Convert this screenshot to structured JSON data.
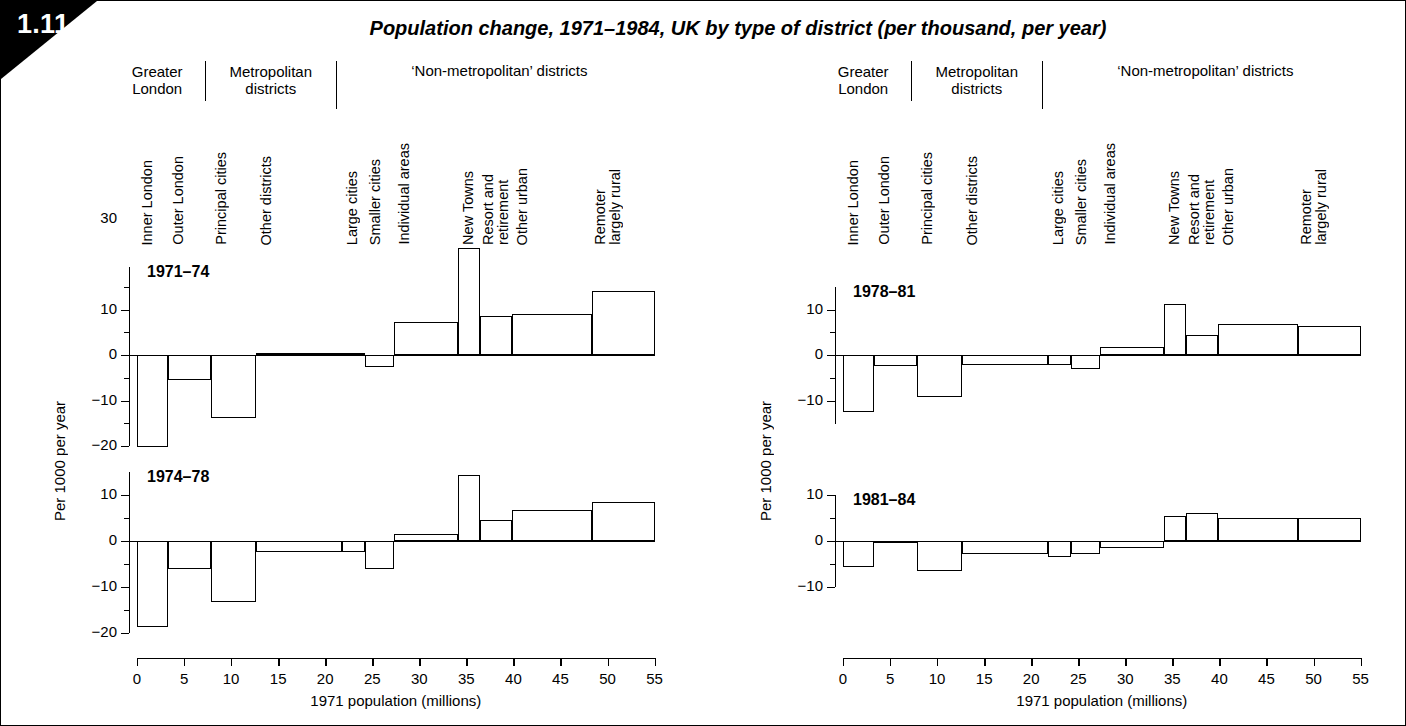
{
  "figure": {
    "number": "1.11",
    "title": "Population change, 1971–1984, UK by type of district (per thousand, per year)"
  },
  "groups": [
    {
      "label": "Greater\nLondon"
    },
    {
      "label": "Metropolitan\ndistricts"
    },
    {
      "label": "‘Non-metropolitan’ districts"
    }
  ],
  "categories": [
    "Inner London",
    "Outer London",
    "Principal cities",
    "Other districts",
    "Large cities",
    "Smaller cities",
    "Individual areas",
    "New Towns",
    "Resort and\nretirement",
    "Other urban",
    "Remoter\nlargely rural"
  ],
  "axes": {
    "ylabel": "Per 1000 per year",
    "xlabel": "1971 population (millions)",
    "xticks": [
      "0",
      "5",
      "10",
      "15",
      "20",
      "25",
      "30",
      "35",
      "40",
      "45",
      "50",
      "55"
    ],
    "yticks_tall": [
      "30",
      "10",
      "0",
      "−10",
      "−20"
    ],
    "yticks_short": [
      "10",
      "0",
      "−10"
    ],
    "yticks_mid": [
      "10",
      "0",
      "−10",
      "−20"
    ]
  },
  "chart_data": [
    {
      "type": "bar",
      "title": "1971–74",
      "xlabel": "1971 population (millions)",
      "ylabel": "Per 1000 per year",
      "xlim": [
        0,
        55
      ],
      "ylim": [
        -20,
        30
      ],
      "grid": false,
      "categories": [
        "Inner London",
        "Outer London",
        "Principal cities",
        "Other districts",
        "Large cities",
        "Smaller cities",
        "Individual areas",
        "New Towns",
        "Resort and retirement",
        "Other urban",
        "Remoter largely rural"
      ],
      "x_edges": [
        0,
        3.3,
        7.9,
        12.6,
        21.8,
        24.2,
        27.3,
        34.1,
        36.5,
        39.8,
        48.4,
        55
      ],
      "values": [
        -20.2,
        -5.5,
        -13.9,
        0.4,
        0.4,
        -2.6,
        7.2,
        23.5,
        8.5,
        9.0,
        14.0
      ]
    },
    {
      "type": "bar",
      "title": "1974–78",
      "xlabel": "1971 population (millions)",
      "ylabel": "Per 1000 per year",
      "xlim": [
        0,
        55
      ],
      "ylim": [
        -20,
        15
      ],
      "grid": false,
      "categories": [
        "Inner London",
        "Outer London",
        "Principal cities",
        "Other districts",
        "Large cities",
        "Smaller cities",
        "Individual areas",
        "New Towns",
        "Resort and retirement",
        "Other urban",
        "Remoter largely rural"
      ],
      "x_edges": [
        0,
        3.3,
        7.9,
        12.6,
        21.8,
        24.2,
        27.3,
        34.1,
        36.5,
        39.8,
        48.4,
        55
      ],
      "values": [
        -18.7,
        -6.2,
        -13.3,
        -2.3,
        -2.3,
        -6.1,
        1.6,
        14.4,
        4.6,
        6.7,
        8.5
      ]
    },
    {
      "type": "bar",
      "title": "1978–81",
      "xlabel": "1971 population (millions)",
      "ylabel": "Per 1000 per year",
      "xlim": [
        0,
        55
      ],
      "ylim": [
        -14,
        13
      ],
      "grid": false,
      "categories": [
        "Inner London",
        "Outer London",
        "Principal cities",
        "Other districts",
        "Large cities",
        "Smaller cities",
        "Individual areas",
        "New Towns",
        "Resort and retirement",
        "Other urban",
        "Remoter largely rural"
      ],
      "x_edges": [
        0,
        3.3,
        7.9,
        12.6,
        21.8,
        24.2,
        27.3,
        34.1,
        36.5,
        39.8,
        48.4,
        55
      ],
      "values": [
        -12.6,
        -2.5,
        -9.2,
        -2.3,
        -2.3,
        -3.1,
        1.8,
        11.2,
        4.4,
        6.8,
        6.4
      ]
    },
    {
      "type": "bar",
      "title": "1981–84",
      "xlabel": "1971 population (millions)",
      "ylabel": "Per 1000 per year",
      "xlim": [
        0,
        55
      ],
      "ylim": [
        -11,
        12
      ],
      "grid": false,
      "categories": [
        "Inner London",
        "Outer London",
        "Principal cities",
        "Other districts",
        "Large cities",
        "Smaller cities",
        "Individual areas",
        "New Towns",
        "Resort and retirement",
        "Other urban",
        "Remoter largely rural"
      ],
      "x_edges": [
        0,
        3.3,
        7.9,
        12.6,
        21.8,
        24.2,
        27.3,
        34.1,
        36.5,
        39.8,
        48.4,
        55
      ],
      "values": [
        -5.6,
        -0.3,
        -6.6,
        -2.9,
        -3.6,
        -2.9,
        -1.5,
        5.5,
        6.1,
        5.0,
        5.0
      ]
    }
  ]
}
